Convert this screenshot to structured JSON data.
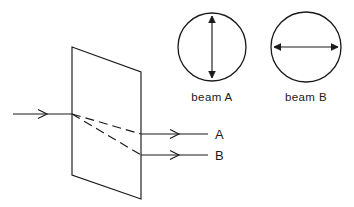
{
  "figure": {
    "background_color": "#ffffff",
    "stroke_color": "#1a1a1a"
  },
  "crystal": {
    "name": "birefringent-plate",
    "shape": "parallelogram",
    "corners": [
      [
        72,
        47
      ],
      [
        141,
        72
      ],
      [
        141,
        199
      ],
      [
        72,
        175
      ]
    ]
  },
  "incident_ray": {
    "label": "",
    "start": [
      13,
      114
    ],
    "end": [
      72,
      114
    ],
    "arrow_at": [
      46,
      114
    ]
  },
  "internal_rays": [
    {
      "name": "internal-ray-a",
      "style": "dashed",
      "start": [
        72,
        114
      ],
      "end": [
        141,
        134
      ]
    },
    {
      "name": "internal-ray-b",
      "style": "dashed",
      "start": [
        72,
        114
      ],
      "end": [
        141,
        155
      ]
    }
  ],
  "exit_rays": [
    {
      "name": "exit-ray-a",
      "label": "A",
      "start": [
        141,
        134
      ],
      "end": [
        208,
        134
      ],
      "arrow_at": [
        178,
        134
      ],
      "label_pos": [
        215,
        139
      ]
    },
    {
      "name": "exit-ray-b",
      "label": "B",
      "start": [
        141,
        155
      ],
      "end": [
        208,
        155
      ],
      "arrow_at": [
        178,
        155
      ],
      "label_pos": [
        215,
        160
      ]
    }
  ],
  "beam_cross_sections": [
    {
      "name": "beam-a",
      "caption": "beam A",
      "center": [
        212,
        47
      ],
      "radius": 34,
      "polarization": "vertical",
      "arrow": {
        "x1": 212,
        "y1": 15,
        "x2": 212,
        "y2": 79
      },
      "caption_pos": [
        212,
        100
      ]
    },
    {
      "name": "beam-b",
      "caption": "beam B",
      "center": [
        306,
        47
      ],
      "radius": 35,
      "polarization": "horizontal",
      "arrow": {
        "x1": 273,
        "y1": 47,
        "x2": 339,
        "y2": 47
      },
      "caption_pos": [
        306,
        100
      ]
    }
  ]
}
